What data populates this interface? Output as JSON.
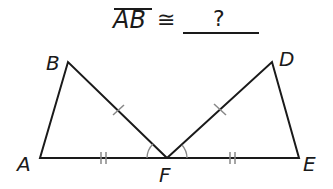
{
  "question": {
    "segment": "AB",
    "relation_symbol": "≅",
    "answer_placeholder": "?"
  },
  "figure": {
    "labels": {
      "A": "A",
      "B": "B",
      "D": "D",
      "E": "E",
      "F": "F"
    },
    "vertices": {
      "A": [
        40,
        158
      ],
      "B": [
        68,
        62
      ],
      "F": [
        167,
        158
      ],
      "D": [
        272,
        62
      ],
      "E": [
        299,
        158
      ]
    },
    "triangles": [
      "ABF",
      "DEF"
    ],
    "markings": {
      "single_tick": [
        "BF",
        "DF"
      ],
      "double_tick": [
        "AF",
        "FE"
      ],
      "congruent_angles": [
        "AFB",
        "DFE"
      ]
    },
    "stroke_color": "#1a1a1a",
    "mark_color": "#888888"
  }
}
